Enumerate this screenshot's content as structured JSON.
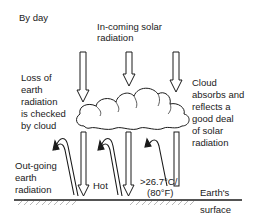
{
  "title": "By day",
  "labels": {
    "incoming": [
      "In-coming solar",
      "radiation"
    ],
    "loss": [
      "Loss of",
      "earth",
      "radiation",
      "is checked",
      "by cloud"
    ],
    "cloud": [
      "Cloud",
      "absorbs and",
      "reflects a",
      "good deal",
      "of solar",
      "radiation"
    ],
    "outgoing": [
      "Out-going",
      "earth",
      "radiation"
    ],
    "hot": "Hot",
    "temp": [
      ">26.7°C/",
      "(80°F)"
    ],
    "surface": [
      "Earth's",
      "surface"
    ]
  },
  "colors": {
    "ink": "#1a1a1a",
    "background": "#ffffff"
  }
}
